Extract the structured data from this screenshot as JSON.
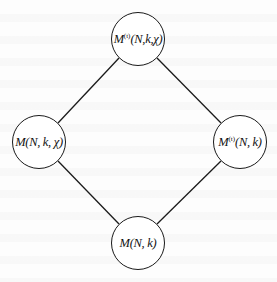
{
  "diagram": {
    "type": "lattice",
    "nodes": [
      {
        "id": "top",
        "base": "M",
        "superscript": "(t)",
        "args": "(N,k,χ)",
        "cx": 138,
        "cy": 39
      },
      {
        "id": "left",
        "base": "M",
        "superscript": "",
        "args": "(N, k, χ)",
        "cx": 39,
        "cy": 142
      },
      {
        "id": "right",
        "base": "M",
        "superscript": "(t)",
        "args": "(N, k)",
        "cx": 240,
        "cy": 142
      },
      {
        "id": "bottom",
        "base": "M",
        "superscript": "",
        "args": "(N, k)",
        "cx": 138,
        "cy": 243
      }
    ],
    "edges": [
      {
        "from": "top",
        "to": "left"
      },
      {
        "from": "top",
        "to": "right"
      },
      {
        "from": "left",
        "to": "bottom"
      },
      {
        "from": "right",
        "to": "bottom"
      }
    ],
    "colors": {
      "stroke": "#1a1a1a",
      "text": "#111111",
      "background": "#ffffff"
    }
  }
}
